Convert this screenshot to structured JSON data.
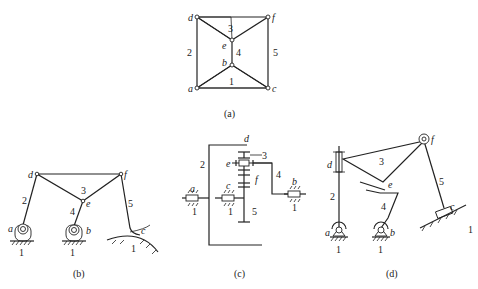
{
  "figure": {
    "subfigures": [
      {
        "id": "a",
        "caption": "(a)",
        "type": "topological-graph",
        "nodes": [
          "a",
          "b",
          "c",
          "d",
          "e",
          "f"
        ],
        "link_labels": [
          "1",
          "2",
          "3",
          "4",
          "5"
        ]
      },
      {
        "id": "b",
        "caption": "(b)",
        "type": "linkage",
        "joint_labels": [
          "a",
          "b",
          "c",
          "d",
          "e",
          "f"
        ],
        "link_labels": [
          "1",
          "2",
          "3",
          "4",
          "5"
        ],
        "ground_labels": [
          "1",
          "1",
          "1"
        ]
      },
      {
        "id": "c",
        "caption": "(c)",
        "type": "gear-train",
        "joint_labels": [
          "a",
          "b",
          "c",
          "d",
          "e",
          "f"
        ],
        "link_labels": [
          "1",
          "2",
          "3",
          "4",
          "5"
        ],
        "ground_labels": [
          "1",
          "1",
          "1"
        ]
      },
      {
        "id": "d",
        "caption": "(d)",
        "type": "slider-linkage",
        "joint_labels": [
          "a",
          "b",
          "c",
          "d",
          "e",
          "f"
        ],
        "link_labels": [
          "1",
          "2",
          "3",
          "4",
          "5"
        ],
        "ground_labels": [
          "1",
          "1",
          "1"
        ]
      }
    ]
  },
  "labels": {
    "a_d": "d",
    "a_f": "f",
    "a_e": "e",
    "a_b": "b",
    "a_a": "a",
    "a_c": "c",
    "a_2": "2",
    "a_3": "3",
    "a_4": "4",
    "a_5": "5",
    "a_1": "1",
    "a_cap": "(a)",
    "b_d": "d",
    "b_f": "f",
    "b_e": "e",
    "b_a": "a",
    "b_b": "b",
    "b_c": "c",
    "b_2": "2",
    "b_3": "3",
    "b_4": "4",
    "b_5": "5",
    "b_g1": "1",
    "b_g2": "1",
    "b_g3": "1",
    "b_cap": "(b)",
    "c_d": "d",
    "c_3": "3",
    "c_e": "e",
    "c_f": "f",
    "c_4": "4",
    "c_2": "2",
    "c_a": "a",
    "c_c": "c",
    "c_b": "b",
    "c_5": "5",
    "c_g1": "1",
    "c_g2": "1",
    "c_g3": "1",
    "c_cap": "(c)",
    "d_d": "d",
    "d_f": "f",
    "d_e": "e",
    "d_a": "a",
    "d_b": "b",
    "d_c": "c",
    "d_2": "2",
    "d_3": "3",
    "d_4": "4",
    "d_5": "5",
    "d_g1": "1",
    "d_g2": "1",
    "d_g3": "1",
    "d_cap": "(d)"
  }
}
